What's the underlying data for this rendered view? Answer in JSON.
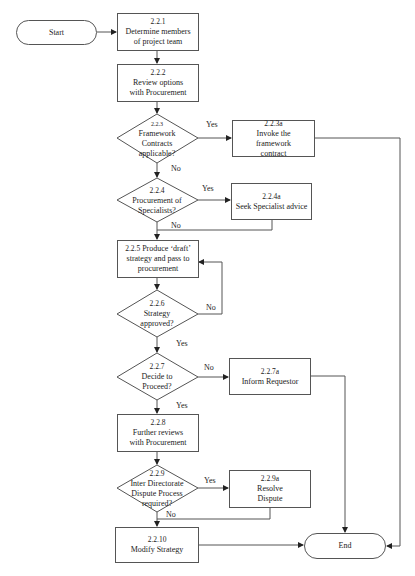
{
  "flowchart": {
    "start": {
      "label": "Start"
    },
    "end": {
      "label": "End"
    },
    "steps": [
      {
        "id": "2.2.1",
        "text": "Determine members of project team"
      },
      {
        "id": "2.2.2",
        "text": "Review options with Procurement"
      },
      {
        "id": "2.2.5",
        "text": "Produce ‘draft’ strategy and pass to procurement"
      },
      {
        "id": "2.2.8",
        "text": "Further reviews with Procurement"
      },
      {
        "id": "2.2.10",
        "text": "Modify Strategy"
      }
    ],
    "decisions": [
      {
        "id": "2.2.3",
        "text": "Framework Contracts applicable?",
        "yes": "Yes",
        "no": "No"
      },
      {
        "id": "2.2.4",
        "text": "Procurement of Specialists?",
        "yes": "Yes",
        "no": "No"
      },
      {
        "id": "2.2.6",
        "text": "Strategy approved?",
        "yes": "Yes",
        "no": "No"
      },
      {
        "id": "2.2.7",
        "text": "Decide to Proceed?",
        "yes": "Yes",
        "no": "No"
      },
      {
        "id": "2.2.9",
        "text": "Inter Directorate Dispute Process required?",
        "yes": "Yes",
        "no": "No"
      }
    ],
    "side_steps": [
      {
        "id": "2.2.3a",
        "text": "Invoke the framework contract"
      },
      {
        "id": "2.2.4a",
        "text": "Seek Specialist advice"
      },
      {
        "id": "2.2.7a",
        "text": "Inform Requestor"
      },
      {
        "id": "2.2.9a",
        "text": "Resolve Dispute"
      }
    ]
  }
}
